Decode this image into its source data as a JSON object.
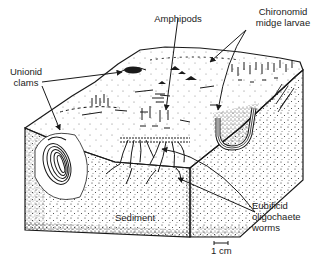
{
  "colors": {
    "ink": "#1a1a1a",
    "background": "#ffffff",
    "label": "#222222"
  },
  "labels": {
    "amphipods": {
      "line1": "Amphipods"
    },
    "chironomid": {
      "line1": "Chironomid",
      "line2": "midge larvae"
    },
    "unionid": {
      "line1": "Unionid",
      "line2": "clams"
    },
    "sediment": {
      "line1": "Sediment"
    },
    "tubificid": {
      "line1": "Eubificid",
      "line2": "oligochaete",
      "line3": "worms"
    },
    "scale": {
      "text": "1 cm"
    }
  }
}
